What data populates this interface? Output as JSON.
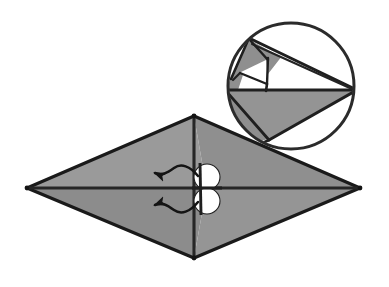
{
  "figure": {
    "title": "Origami rhombus fold step with magnified inset",
    "caption": "Gray shaded rhombus with both diagonals drawn, a pair of white circular pivot markers at the center, two curved arrows indicating flaps swinging to the left, and a circular magnifier inset showing the left vertex detail.",
    "canvas": {
      "width": 389,
      "height": 287,
      "background": "#ffffff"
    }
  },
  "colors": {
    "paper_front": "#919191",
    "paper_front_light": "#9e9e9e",
    "paper_back": "#ffffff",
    "outline": "#1a1a1a",
    "crease": "#262626",
    "marker_fill": "#ffffff",
    "marker_stroke": "#1f1f1f",
    "arrow": "#141414",
    "inset_ring": "#2b2b2b"
  },
  "main_shape": {
    "name": "rhombus",
    "label": "folded kite base",
    "vertices": {
      "left": {
        "x": 27,
        "y": 188
      },
      "top": {
        "x": 194,
        "y": 116
      },
      "right": {
        "x": 360,
        "y": 188
      },
      "bottom": {
        "x": 194,
        "y": 258
      }
    },
    "diagonals": [
      {
        "name": "horizontal-diagonal",
        "from": "left",
        "to": "right"
      },
      {
        "name": "vertical-diagonal",
        "from": "top",
        "to": "bottom"
      }
    ],
    "stroke_width": 3.2
  },
  "center_markers": {
    "name": "pivot-circles",
    "count": 2,
    "radius": 13,
    "items": [
      {
        "cx": 207,
        "cy": 177,
        "label": "upper-pivot-circle"
      },
      {
        "cx": 207,
        "cy": 201,
        "label": "lower-pivot-circle"
      }
    ]
  },
  "arrows": [
    {
      "name": "upper-fold-arrow",
      "direction": "left",
      "label": "swing upper flap left",
      "path": "M 198 176 C 190 166, 181 163, 174 168 C 167 173, 162 176, 155 173",
      "head": {
        "x": 155,
        "y": 173,
        "angle": 200
      }
    },
    {
      "name": "lower-fold-arrow",
      "direction": "left",
      "label": "swing lower flap left",
      "path": "M 198 202 C 190 212, 181 215, 174 210 C 167 205, 162 202, 155 205",
      "head": {
        "x": 155,
        "y": 205,
        "angle": 160
      }
    }
  ],
  "inset": {
    "name": "magnifier-inset",
    "label": "Detail of left vertex fold",
    "circle": {
      "cx": 291,
      "cy": 86,
      "r": 64
    },
    "ring_stroke_width": 3,
    "contents": {
      "description": "Enlarged view of the narrow point: a shaded lower half, a thin pointed flap lifted toward the upper left, and creases radiating to the right-hand tip.",
      "regions": [
        {
          "name": "lower-shaded-wedge",
          "fill": "paper_front"
        },
        {
          "name": "upper-left-shaded-flap",
          "fill": "paper_front"
        },
        {
          "name": "white-inner-triangle",
          "fill": "paper_back"
        },
        {
          "name": "white-long-sliver",
          "fill": "paper_back"
        }
      ]
    }
  }
}
